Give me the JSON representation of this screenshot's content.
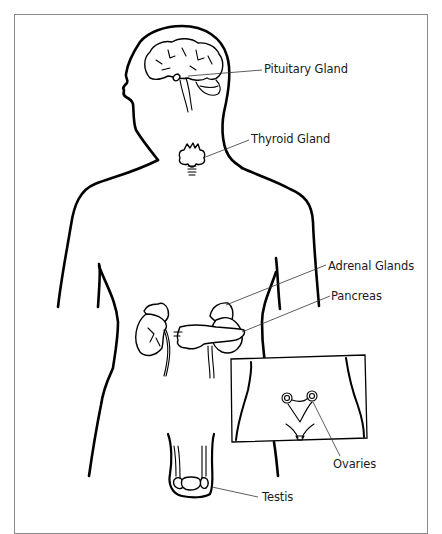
{
  "figure": {
    "colors": {
      "line": "#000000",
      "frame": "#8a8a8a",
      "label": "#1a1a1a",
      "background": "#ffffff"
    }
  },
  "labels": {
    "pituitary": "Pituitary Gland",
    "thyroid": "Thyroid Gland",
    "adrenal": "Adrenal Glands",
    "pancreas": "Pancreas",
    "ovaries": "Ovaries",
    "testis": "Testis"
  }
}
